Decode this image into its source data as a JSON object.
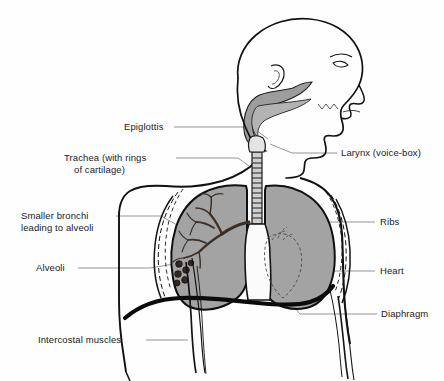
{
  "figure": {
    "type": "anatomical-diagram",
    "background_color": "#fefefe",
    "outline_color": "#111111",
    "tissue_fill_color": "#a3a3a3",
    "leader_line_color": "#7b7b7b"
  },
  "labels": {
    "epiglottis": "Epiglottis",
    "trachea_line1": "Trachea (with rings",
    "trachea_line2": "of cartilage)",
    "bronchi_line1": "Smaller bronchi",
    "bronchi_line2": "leading to alveoli",
    "alveoli": "Alveoli",
    "intercostal": "Intercostal muscles",
    "larynx": "Larynx (voice-box)",
    "ribs": "Ribs",
    "heart": "Heart",
    "diaphragm": "Diaphragm"
  },
  "parts": [
    {
      "name": "head-profile",
      "label": ""
    },
    {
      "name": "nasal-cavity",
      "label": ""
    },
    {
      "name": "oral-cavity",
      "label": ""
    },
    {
      "name": "epiglottis",
      "label": "Epiglottis"
    },
    {
      "name": "larynx",
      "label": "Larynx (voice-box)"
    },
    {
      "name": "trachea",
      "label": "Trachea (with rings of cartilage)"
    },
    {
      "name": "left-lung",
      "label": ""
    },
    {
      "name": "right-lung",
      "label": ""
    },
    {
      "name": "bronchi",
      "label": "Smaller bronchi leading to alveoli"
    },
    {
      "name": "alveoli",
      "label": "Alveoli"
    },
    {
      "name": "ribs",
      "label": "Ribs"
    },
    {
      "name": "heart",
      "label": "Heart"
    },
    {
      "name": "diaphragm",
      "label": "Diaphragm"
    },
    {
      "name": "intercostal-muscles",
      "label": "Intercostal muscles"
    }
  ]
}
